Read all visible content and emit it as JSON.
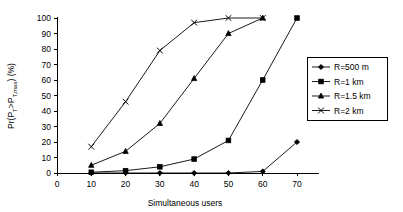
{
  "chart_data": {
    "type": "line",
    "title": "",
    "subtitle": "",
    "xlabel": "Simultaneous users",
    "ylabel": "Pr(P_T>P_T,max) (%)",
    "ylabel_parts": {
      "prefix": "Pr(P",
      "sub1": "T",
      "mid": ">P",
      "sub2": "T,max",
      "suffix": ") (%)"
    },
    "x": [
      10,
      20,
      30,
      40,
      50,
      60,
      70
    ],
    "xlim": [
      0,
      70
    ],
    "ylim": [
      0,
      100
    ],
    "xticks": [
      0,
      10,
      20,
      30,
      40,
      50,
      60,
      70
    ],
    "yticks": [
      0,
      10,
      20,
      30,
      40,
      50,
      60,
      70,
      80,
      90,
      100
    ],
    "grid": false,
    "legend_position": "right",
    "series": [
      {
        "name": "R=500 m",
        "marker": "diamond",
        "x": [
          10,
          20,
          30,
          40,
          50,
          60,
          70
        ],
        "values": [
          0,
          0,
          0,
          0,
          0,
          1,
          20
        ]
      },
      {
        "name": "R=1 km",
        "marker": "square",
        "x": [
          10,
          20,
          30,
          40,
          50,
          60,
          70
        ],
        "values": [
          0.5,
          1.5,
          4,
          9,
          21,
          60,
          100
        ]
      },
      {
        "name": "R=1.5 km",
        "marker": "triangle",
        "x": [
          10,
          20,
          30,
          40,
          50,
          60
        ],
        "values": [
          5,
          14,
          32,
          61,
          90,
          100
        ]
      },
      {
        "name": "R=2 km",
        "marker": "cross",
        "x": [
          10,
          20,
          30,
          40,
          50,
          60
        ],
        "values": [
          17,
          46,
          79,
          97,
          100,
          100
        ]
      }
    ]
  },
  "axes": {
    "x_tick_labels": [
      "0",
      "10",
      "20",
      "30",
      "40",
      "50",
      "60",
      "70"
    ],
    "y_tick_labels": [
      "0",
      "10",
      "20",
      "30",
      "40",
      "50",
      "60",
      "70",
      "80",
      "90",
      "100"
    ],
    "x_axis_title": "Simultaneous users"
  },
  "legend": {
    "items": [
      {
        "label": "R=500 m",
        "marker": "diamond-marker"
      },
      {
        "label": "R=1 km",
        "marker": "square-marker"
      },
      {
        "label": "R=1.5 km",
        "marker": "square-marker"
      },
      {
        "label": "R=2 km",
        "marker": "cross-marker"
      }
    ]
  },
  "colors": {
    "line": "#000000",
    "axis": "#000000",
    "background": "#ffffff",
    "legend_border": "#000000"
  }
}
